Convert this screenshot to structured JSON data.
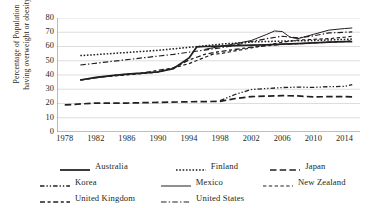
{
  "chart_data": {
    "type": "line",
    "title": "",
    "xlabel": "",
    "ylabel": "Percentage of Population having overweight or obesity",
    "ylabel_line1": "Percentage of Population",
    "ylabel_line2": "having overweight or obesity",
    "xlim": [
      1977,
      2016
    ],
    "ylim": [
      0,
      80
    ],
    "yticks": [
      0,
      10,
      20,
      30,
      40,
      50,
      60,
      70,
      80
    ],
    "xticks": [
      1978,
      1982,
      1986,
      1990,
      1994,
      1998,
      2002,
      2006,
      2010,
      2014
    ],
    "grid": "horizontal",
    "legend_position": "bottom",
    "line_color": "#231f20",
    "grid_color": "#d9d9d9",
    "axis_color": "#808080",
    "series": [
      {
        "name": "Australia",
        "style": "solid-thick",
        "x": [
          1980,
          1982,
          1984,
          1986,
          1988,
          1990,
          1992,
          1994,
          1995,
          1996,
          1998,
          2000,
          2002,
          2004,
          2006,
          2008,
          2010,
          2012,
          2014,
          2015
        ],
        "values": [
          36.5,
          38.3,
          39.6,
          40.6,
          41.3,
          42.2,
          44.5,
          52.0,
          59.8,
          60.0,
          60.3,
          60.6,
          60.9,
          61.2,
          61.6,
          62.0,
          62.6,
          63.0,
          63.4,
          63.4
        ]
      },
      {
        "name": "Finland",
        "style": "dotted",
        "x": [
          1980,
          1982,
          1986,
          1990,
          1994,
          1998,
          2002,
          2006,
          2010,
          2012,
          2014,
          2015
        ],
        "values": [
          53.6,
          54.3,
          55.8,
          57.3,
          59.4,
          61.6,
          63.2,
          63.8,
          64.2,
          64.6,
          65.0,
          65.2
        ]
      },
      {
        "name": "Japan",
        "style": "long-dash",
        "x": [
          1978,
          1982,
          1986,
          1990,
          1994,
          1998,
          2000,
          2002,
          2004,
          2006,
          2008,
          2010,
          2012,
          2014,
          2015
        ],
        "values": [
          19.0,
          20.3,
          20.3,
          20.8,
          21.2,
          21.5,
          23.5,
          24.8,
          25.2,
          25.5,
          25.3,
          24.6,
          24.8,
          24.8,
          24.6
        ]
      },
      {
        "name": "Korea",
        "style": "dash-dot-dot",
        "x": [
          1998,
          2000,
          2002,
          2004,
          2006,
          2008,
          2010,
          2012,
          2014,
          2015
        ],
        "values": [
          22.0,
          26.5,
          29.8,
          30.5,
          31.2,
          31.5,
          31.3,
          31.8,
          32.0,
          33.2
        ]
      },
      {
        "name": "Mexico",
        "style": "solid-thin",
        "x": [
          1996,
          1998,
          2000,
          2002,
          2004,
          2005,
          2006,
          2007,
          2008,
          2010,
          2012,
          2014,
          2015
        ],
        "values": [
          58.0,
          60.0,
          62.0,
          64.2,
          68.5,
          70.9,
          70.5,
          66.5,
          65.5,
          68.5,
          71.5,
          72.6,
          73.0
        ]
      },
      {
        "name": "New Zealand",
        "style": "dashed",
        "x": [
          1980,
          1982,
          1986,
          1990,
          1994,
          1997,
          1998,
          2002,
          2006,
          2008,
          2010,
          2012,
          2014,
          2015
        ],
        "values": [
          36.5,
          38.2,
          40.0,
          42.0,
          48.0,
          54.5,
          55.0,
          59.0,
          63.0,
          64.5,
          65.0,
          65.5,
          66.5,
          67.2
        ]
      },
      {
        "name": "United Kingdom",
        "style": "dash-dash",
        "x": [
          1980,
          1984,
          1988,
          1992,
          1994,
          1996,
          1998,
          2002,
          2006,
          2010,
          2012,
          2014,
          2015
        ],
        "values": [
          36.5,
          39.5,
          41.5,
          45.0,
          50.5,
          54.5,
          56.5,
          59.5,
          61.5,
          62.5,
          63.0,
          63.5,
          64.0
        ]
      },
      {
        "name": "United States",
        "style": "dash-dot",
        "x": [
          1980,
          1984,
          1988,
          1992,
          1996,
          1998,
          2000,
          2002,
          2004,
          2006,
          2008,
          2010,
          2012,
          2014,
          2015
        ],
        "values": [
          47.0,
          49.5,
          52.0,
          54.5,
          57.5,
          59.0,
          61.0,
          63.5,
          65.5,
          67.2,
          66.0,
          67.5,
          69.5,
          70.0,
          70.2
        ]
      }
    ]
  },
  "legend": {
    "rows": [
      [
        "Australia",
        "Finland",
        "Japan"
      ],
      [
        "Korea",
        "Mexico",
        "New Zealand"
      ],
      [
        "United Kingdom",
        "United States"
      ]
    ],
    "items": [
      {
        "label": "Australia",
        "style": "solid-thick"
      },
      {
        "label": "Finland",
        "style": "dotted"
      },
      {
        "label": "Japan",
        "style": "long-dash"
      },
      {
        "label": "Korea",
        "style": "dash-dot-dot"
      },
      {
        "label": "Mexico",
        "style": "solid-thin"
      },
      {
        "label": "New Zealand",
        "style": "dashed"
      },
      {
        "label": "United Kingdom",
        "style": "dash-dash"
      },
      {
        "label": "United States",
        "style": "dash-dot"
      }
    ]
  }
}
